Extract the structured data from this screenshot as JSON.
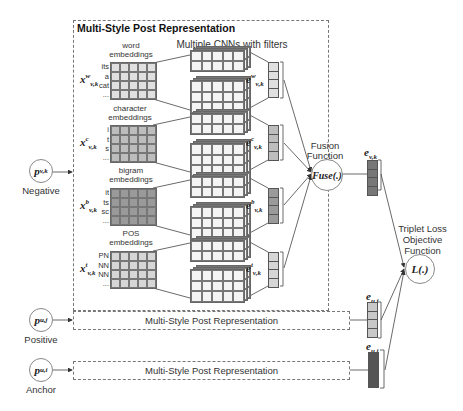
{
  "diagram": {
    "main_box_title": "Multi-Style Post Representation",
    "cnn_header": "Multiple CNNs with filters",
    "embeddings": [
      {
        "label_line1": "word",
        "label_line2": "embeddings",
        "symbol": "x",
        "sup": "w",
        "sub": "v,k",
        "rows": [
          "its",
          "a",
          "cat",
          "..."
        ],
        "fill": "#e0e0e0",
        "output_symbol": "e",
        "output_sup": "w",
        "output_sub": "v,k",
        "output_fill": "#e0e0e0"
      },
      {
        "label_line1": "character",
        "label_line2": "embeddings",
        "symbol": "x",
        "sup": "c",
        "sub": "v,k",
        "rows": [
          "i",
          "t",
          "s",
          "..."
        ],
        "fill": "#bdbdbd",
        "output_symbol": "e",
        "output_sup": "c",
        "output_sub": "v,k",
        "output_fill": "#bdbdbd"
      },
      {
        "label_line1": "bigram",
        "label_line2": "embeddings",
        "symbol": "x",
        "sup": "b",
        "sub": "v,k",
        "rows": [
          "it",
          "ts",
          "sc",
          "..."
        ],
        "fill": "#9a9a9a",
        "output_symbol": "e",
        "output_sup": "b",
        "output_sub": "v,k",
        "output_fill": "#9a9a9a"
      },
      {
        "label_line1": "POS",
        "label_line2": "embeddings",
        "symbol": "x",
        "sup": "t",
        "sub": "v,k",
        "rows": [
          "PN",
          "NN",
          "NN",
          "..."
        ],
        "fill": "#d6d6d6",
        "output_symbol": "e",
        "output_sup": "t",
        "output_sub": "v,k",
        "output_fill": "#d6d6d6"
      }
    ],
    "fusion": {
      "label_line1": "Fusion",
      "label_line2": "Function",
      "circle_text": "Fuse(.)"
    },
    "fused_vector": {
      "symbol": "e",
      "sub": "v,k",
      "fill": "#777777"
    },
    "loss": {
      "label_line1": "Triplet Loss",
      "label_line2": "Objective",
      "label_line3": "Function",
      "circle_text": "L(.)"
    },
    "inputs": [
      {
        "symbol": "p",
        "sub": "v,k",
        "label": "Negative"
      },
      {
        "symbol": "p",
        "sub": "u,j",
        "label": "Positive"
      },
      {
        "symbol": "p",
        "sub": "u,i",
        "label": "Anchor"
      }
    ],
    "collapsed_boxes": [
      {
        "label": "Multi-Style Post Representation"
      },
      {
        "label": "Multi-Style Post Representation"
      }
    ],
    "positive_vector": {
      "symbol": "e",
      "sub": "u,j",
      "fill": "#c8c8c8"
    },
    "anchor_vector": {
      "symbol": "e",
      "sub": "u,i",
      "fill": "#555555"
    }
  }
}
